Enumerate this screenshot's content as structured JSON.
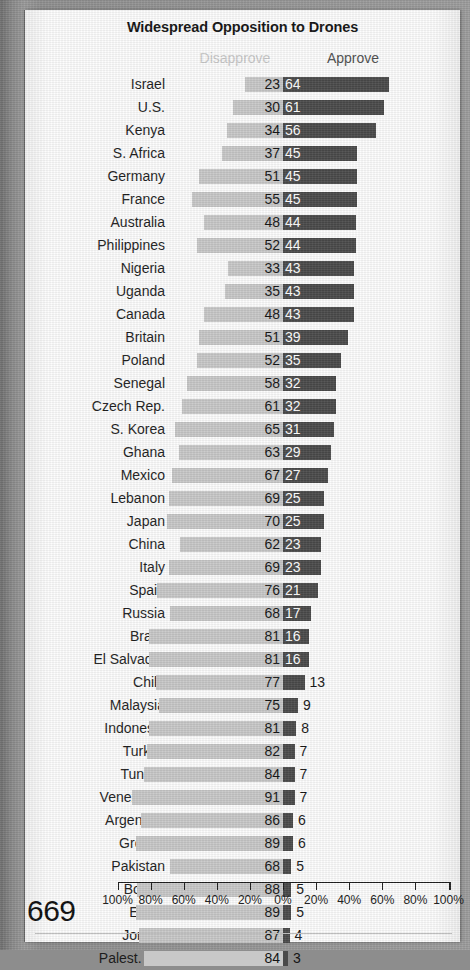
{
  "page": {
    "page_number": "669",
    "background_color": "#8d8d8d",
    "paper_color": "#fdfdfd"
  },
  "header": {
    "title": "Widespread Opposition to Drones",
    "left_column_label": "Disapprove",
    "right_column_label": "Approve",
    "left_column_color": "#c9c9c9",
    "right_column_color": "#4e4e4e"
  },
  "chart_data": {
    "type": "bar",
    "orientation": "horizontal-diverging",
    "title": "Widespread Opposition to Drones",
    "xlabel": "",
    "ylabel": "",
    "grid": false,
    "legend_position": "top",
    "xlim": [
      -100,
      100
    ],
    "axis_ticks": [
      "100%",
      "80%",
      "60%",
      "40%",
      "20%",
      "0%",
      "20%",
      "40%",
      "60%",
      "80%",
      "100%"
    ],
    "axis_tick_values": [
      -100,
      -80,
      -60,
      -40,
      -20,
      0,
      20,
      40,
      60,
      80,
      100
    ],
    "series": [
      {
        "name": "Disapprove",
        "color": "#c8c8c8",
        "direction": "left"
      },
      {
        "name": "Approve",
        "color": "#4a4a4a",
        "direction": "right"
      }
    ],
    "categories": [
      "Israel",
      "U.S.",
      "Kenya",
      "S. Africa",
      "Germany",
      "France",
      "Australia",
      "Philippines",
      "Nigeria",
      "Uganda",
      "Canada",
      "Britain",
      "Poland",
      "Senegal",
      "Czech Rep.",
      "S. Korea",
      "Ghana",
      "Mexico",
      "Lebanon",
      "Japan",
      "China",
      "Italy",
      "Spain",
      "Russia",
      "Brazil",
      "El Salvador",
      "Chile",
      "Malaysia",
      "Indonesia",
      "Turkey",
      "Tunisia",
      "Venezuela",
      "Argentina",
      "Greece",
      "Pakistan",
      "Bolivia",
      "Egypt",
      "Jordan",
      "Palest. ter."
    ],
    "disapprove": [
      23,
      30,
      34,
      37,
      51,
      55,
      48,
      52,
      33,
      35,
      48,
      51,
      52,
      58,
      61,
      65,
      63,
      67,
      69,
      70,
      62,
      69,
      76,
      68,
      81,
      81,
      77,
      75,
      81,
      82,
      84,
      91,
      86,
      89,
      68,
      88,
      89,
      87,
      84
    ],
    "approve": [
      64,
      61,
      56,
      45,
      45,
      45,
      44,
      44,
      43,
      43,
      43,
      39,
      35,
      32,
      32,
      31,
      29,
      27,
      25,
      25,
      23,
      23,
      21,
      17,
      16,
      16,
      13,
      9,
      8,
      7,
      7,
      7,
      6,
      6,
      5,
      5,
      5,
      4,
      3
    ]
  },
  "rows": [
    {
      "country": "Israel",
      "disapprove": 23,
      "approve": 64
    },
    {
      "country": "U.S.",
      "disapprove": 30,
      "approve": 61
    },
    {
      "country": "Kenya",
      "disapprove": 34,
      "approve": 56
    },
    {
      "country": "S. Africa",
      "disapprove": 37,
      "approve": 45
    },
    {
      "country": "Germany",
      "disapprove": 51,
      "approve": 45
    },
    {
      "country": "France",
      "disapprove": 55,
      "approve": 45
    },
    {
      "country": "Australia",
      "disapprove": 48,
      "approve": 44
    },
    {
      "country": "Philippines",
      "disapprove": 52,
      "approve": 44
    },
    {
      "country": "Nigeria",
      "disapprove": 33,
      "approve": 43
    },
    {
      "country": "Uganda",
      "disapprove": 35,
      "approve": 43
    },
    {
      "country": "Canada",
      "disapprove": 48,
      "approve": 43
    },
    {
      "country": "Britain",
      "disapprove": 51,
      "approve": 39
    },
    {
      "country": "Poland",
      "disapprove": 52,
      "approve": 35
    },
    {
      "country": "Senegal",
      "disapprove": 58,
      "approve": 32
    },
    {
      "country": "Czech Rep.",
      "disapprove": 61,
      "approve": 32
    },
    {
      "country": "S. Korea",
      "disapprove": 65,
      "approve": 31
    },
    {
      "country": "Ghana",
      "disapprove": 63,
      "approve": 29
    },
    {
      "country": "Mexico",
      "disapprove": 67,
      "approve": 27
    },
    {
      "country": "Lebanon",
      "disapprove": 69,
      "approve": 25
    },
    {
      "country": "Japan",
      "disapprove": 70,
      "approve": 25
    },
    {
      "country": "China",
      "disapprove": 62,
      "approve": 23
    },
    {
      "country": "Italy",
      "disapprove": 69,
      "approve": 23
    },
    {
      "country": "Spain",
      "disapprove": 76,
      "approve": 21
    },
    {
      "country": "Russia",
      "disapprove": 68,
      "approve": 17
    },
    {
      "country": "Brazil",
      "disapprove": 81,
      "approve": 16
    },
    {
      "country": "El Salvador",
      "disapprove": 81,
      "approve": 16
    },
    {
      "country": "Chile",
      "disapprove": 77,
      "approve": 13
    },
    {
      "country": "Malaysia",
      "disapprove": 75,
      "approve": 9
    },
    {
      "country": "Indonesia",
      "disapprove": 81,
      "approve": 8
    },
    {
      "country": "Turkey",
      "disapprove": 82,
      "approve": 7
    },
    {
      "country": "Tunisia",
      "disapprove": 84,
      "approve": 7
    },
    {
      "country": "Venezuela",
      "disapprove": 91,
      "approve": 7
    },
    {
      "country": "Argentina",
      "disapprove": 86,
      "approve": 6
    },
    {
      "country": "Greece",
      "disapprove": 89,
      "approve": 6
    },
    {
      "country": "Pakistan",
      "disapprove": 68,
      "approve": 5
    },
    {
      "country": "Bolivia",
      "disapprove": 88,
      "approve": 5
    },
    {
      "country": "Egypt",
      "disapprove": 89,
      "approve": 5
    },
    {
      "country": "Jordan",
      "disapprove": 87,
      "approve": 4
    },
    {
      "country": "Palest. ter.",
      "disapprove": 84,
      "approve": 3
    }
  ]
}
